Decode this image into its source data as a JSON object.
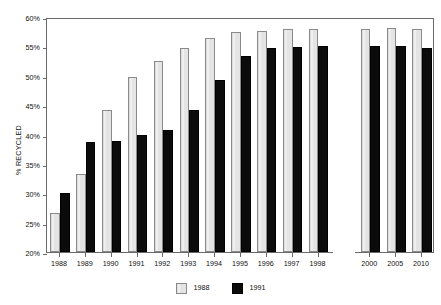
{
  "chart_data": {
    "type": "bar",
    "title": "",
    "subtitle": "",
    "xlabel": "",
    "ylabel": "% RECYCLED",
    "ylim": [
      20,
      60
    ],
    "ytick_step": 5,
    "ytick_labels": [
      "60%",
      "55%",
      "50%",
      "45%",
      "40%",
      "35%",
      "30%",
      "25%",
      "20%"
    ],
    "ytick_values": [
      60,
      55,
      50,
      45,
      40,
      35,
      30,
      25,
      20
    ],
    "grid": false,
    "legend_position": "bottom-center",
    "axis_break_after_category": "1998",
    "categories": [
      "1988",
      "1989",
      "1990",
      "1991",
      "1992",
      "1993",
      "1994",
      "1995",
      "1996",
      "1997",
      "1998",
      "2000",
      "2005",
      "2010"
    ],
    "series": [
      {
        "name": "1988",
        "color": "#e9e9e9",
        "edge_color": "#8a8a8a",
        "values": [
          26.7,
          33.2,
          44.2,
          49.8,
          52.5,
          54.8,
          56.5,
          57.5,
          57.7,
          57.9,
          57.9,
          58.0,
          58.2,
          58.0
        ]
      },
      {
        "name": "1991",
        "color": "#0b0b0b",
        "edge_color": "#000000",
        "values": [
          30.1,
          38.7,
          38.9,
          40.0,
          40.8,
          44.2,
          49.3,
          53.3,
          54.8,
          54.9,
          55.0,
          55.1,
          55.0,
          54.7
        ]
      }
    ],
    "legend": [
      {
        "label": "1988",
        "swatch": "s1988"
      },
      {
        "label": "1991",
        "swatch": "s1991"
      }
    ]
  }
}
